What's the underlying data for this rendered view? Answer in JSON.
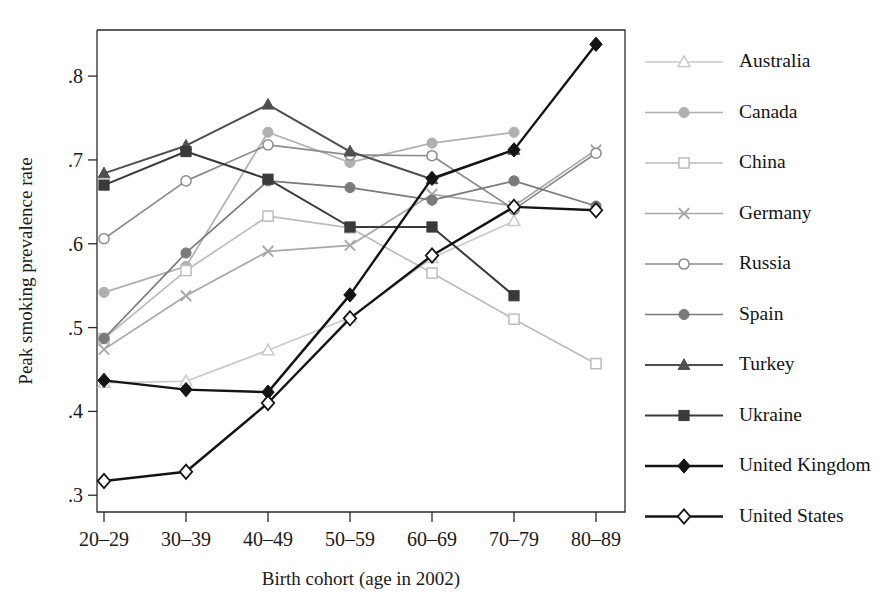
{
  "chart_data": {
    "type": "line",
    "title": "",
    "xlabel": "Birth cohort (age in 2002)",
    "ylabel": "Peak smoking prevalence rate",
    "categories": [
      "20–29",
      "30–39",
      "40–49",
      "50–59",
      "60–69",
      "70–79",
      "80–89"
    ],
    "ylim": [
      0.28,
      0.855
    ],
    "yticks": [
      0.3,
      0.4,
      0.5,
      0.6,
      0.7,
      0.8
    ],
    "ytick_labels": [
      ".3",
      ".4",
      ".5",
      ".6",
      ".7",
      ".8"
    ],
    "grid": false,
    "legend_position": "right",
    "series": [
      {
        "name": "Australia",
        "marker": "triangle-open",
        "color": "#c9c9c9",
        "values": [
          0.434,
          0.436,
          0.473,
          0.512,
          0.583,
          0.627,
          null
        ]
      },
      {
        "name": "Canada",
        "marker": "circle-filled",
        "color": "#b0b0b0",
        "values": [
          0.542,
          0.573,
          0.733,
          0.697,
          0.72,
          0.733,
          null
        ]
      },
      {
        "name": "China",
        "marker": "square-open",
        "color": "#bdbdbd",
        "values": [
          0.487,
          0.568,
          0.633,
          0.619,
          0.565,
          0.51,
          0.457
        ]
      },
      {
        "name": "Germany",
        "marker": "x",
        "color": "#a8a8a8",
        "values": [
          0.474,
          0.538,
          0.591,
          0.598,
          0.659,
          0.645,
          0.712
        ]
      },
      {
        "name": "Russia",
        "marker": "circle-open",
        "color": "#8c8c8c",
        "values": [
          0.606,
          0.675,
          0.718,
          0.706,
          0.705,
          0.641,
          0.708
        ]
      },
      {
        "name": "Spain",
        "marker": "circle-filled",
        "color": "#7a7a7a",
        "values": [
          0.487,
          0.589,
          0.675,
          0.667,
          0.652,
          0.675,
          0.645
        ]
      },
      {
        "name": "Turkey",
        "marker": "triangle-filled",
        "color": "#4f4f4f",
        "values": [
          0.684,
          0.717,
          0.766,
          0.71,
          0.677,
          0.712,
          null
        ]
      },
      {
        "name": "Ukraine",
        "marker": "square-filled",
        "color": "#3a3a3a",
        "values": [
          0.67,
          0.71,
          0.677,
          0.62,
          0.62,
          0.538,
          null
        ]
      },
      {
        "name": "United Kingdom",
        "marker": "diamond-filled",
        "color": "#141414",
        "values": [
          0.437,
          0.426,
          0.423,
          0.539,
          0.678,
          0.712,
          0.838
        ]
      },
      {
        "name": "United States",
        "marker": "diamond-open",
        "color": "#141414",
        "values": [
          0.317,
          0.328,
          0.41,
          0.511,
          0.586,
          0.644,
          0.64
        ]
      }
    ]
  }
}
